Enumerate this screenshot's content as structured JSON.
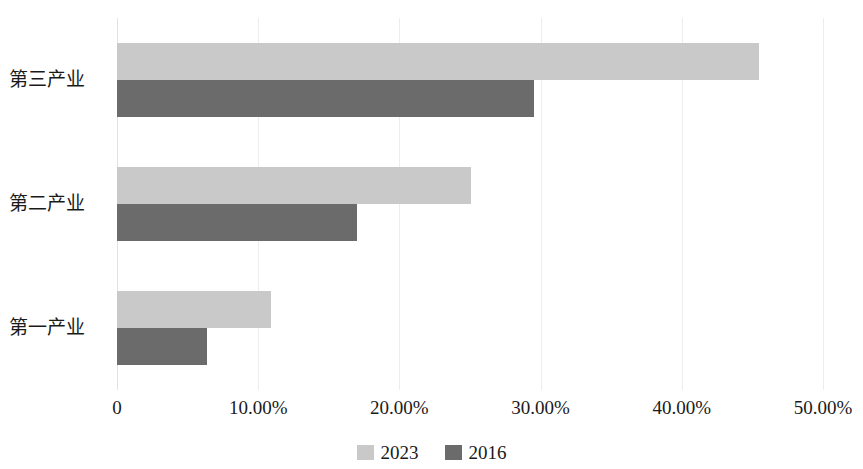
{
  "chart_data": {
    "type": "bar",
    "orientation": "horizontal",
    "title": "",
    "subtitle": "",
    "xlabel": "",
    "ylabel": "",
    "categories": [
      "第三产业",
      "第二产业",
      "第一产业"
    ],
    "series": [
      {
        "name": "2023",
        "color": "#c9c9c9",
        "values": [
          45.5,
          25.1,
          10.9
        ]
      },
      {
        "name": "2016",
        "color": "#6b6b6b",
        "values": [
          29.5,
          17.0,
          6.4
        ]
      }
    ],
    "xlim": [
      0,
      50
    ],
    "x_tick_values": [
      0,
      10,
      20,
      30,
      40,
      50
    ],
    "x_tick_labels": [
      "0",
      "10.00%",
      "20.00%",
      "30.00%",
      "40.00%",
      "50.00%"
    ],
    "grid": true,
    "grid_axis": "x",
    "legend_position": "bottom-center",
    "legend_entries": [
      "2023",
      "2016"
    ]
  },
  "axis": {
    "x_ticks": [
      {
        "label": "0",
        "value": 0
      },
      {
        "label": "10.00%",
        "value": 10
      },
      {
        "label": "20.00%",
        "value": 20
      },
      {
        "label": "30.00%",
        "value": 30
      },
      {
        "label": "40.00%",
        "value": 40
      },
      {
        "label": "50.00%",
        "value": 50
      }
    ],
    "categories": [
      {
        "label": "第三产业"
      },
      {
        "label": "第二产业"
      },
      {
        "label": "第一产业"
      }
    ]
  },
  "legend": {
    "items": [
      {
        "label": "2023",
        "color": "#c9c9c9"
      },
      {
        "label": "2016",
        "color": "#6b6b6b"
      }
    ]
  },
  "colors": {
    "series_2023": "#c9c9c9",
    "series_2016": "#6b6b6b",
    "gridline": "#ededed",
    "background": "#ffffff",
    "text": "#1a1a1a"
  }
}
